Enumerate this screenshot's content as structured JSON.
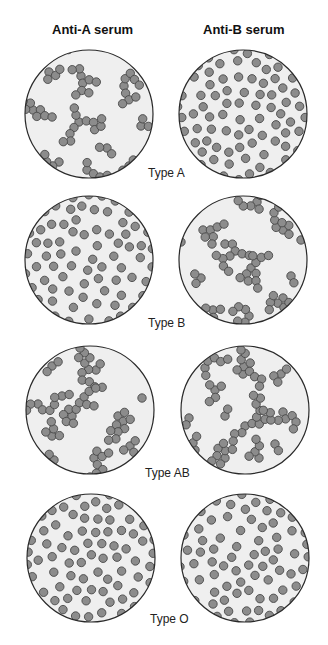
{
  "headings": {
    "col_a": "Anti-A serum",
    "col_b": "Anti-B serum"
  },
  "colors": {
    "dish_fill": "#efefef",
    "dish_stroke": "#2a2a2a",
    "cell_fill": "#8c8c8c",
    "cell_stroke": "#4a4a4a"
  },
  "rows": [
    {
      "label": "Type A",
      "anti_a": {
        "state": "agglutinated",
        "seed": 11,
        "clusters": [
          [
            -40,
            -42,
            4
          ],
          [
            -8,
            -38,
            9
          ],
          [
            35,
            -28,
            9
          ],
          [
            -56,
            -4,
            8
          ],
          [
            -10,
            8,
            12
          ],
          [
            18,
            34,
            3
          ],
          [
            -30,
            48,
            4
          ],
          [
            -2,
            56,
            7
          ],
          [
            40,
            52,
            3
          ],
          [
            -28,
            -64,
            4
          ],
          [
            52,
            12,
            3
          ],
          [
            60,
            48,
            3
          ]
        ]
      },
      "anti_b": {
        "state": "dispersed",
        "seed": 21,
        "count": 78
      },
      "label_pos": [
        148,
        166
      ]
    },
    {
      "label": "Type B",
      "anti_a": {
        "state": "dispersed",
        "seed": 31,
        "count": 80
      },
      "anti_b": {
        "state": "agglutinated",
        "seed": 41,
        "clusters": [
          [
            -40,
            -30,
            7
          ],
          [
            -18,
            -16,
            10
          ],
          [
            14,
            -58,
            7
          ],
          [
            8,
            8,
            11
          ],
          [
            40,
            -30,
            8
          ],
          [
            -42,
            18,
            3
          ],
          [
            48,
            16,
            2
          ],
          [
            -30,
            50,
            5
          ],
          [
            6,
            56,
            8
          ],
          [
            40,
            38,
            8
          ],
          [
            58,
            -20,
            1
          ],
          [
            -62,
            -18,
            2
          ]
        ]
      }
    },
    {
      "label": "Type AB",
      "anti_a": {
        "state": "agglutinated",
        "seed": 51,
        "clusters": [
          [
            -38,
            -44,
            3
          ],
          [
            6,
            -40,
            12
          ],
          [
            -52,
            -6,
            9
          ],
          [
            -28,
            -14,
            3
          ],
          [
            -18,
            6,
            12
          ],
          [
            28,
            6,
            10
          ],
          [
            -38,
            26,
            5
          ],
          [
            -36,
            50,
            2
          ],
          [
            4,
            48,
            9
          ],
          [
            40,
            36,
            4
          ],
          [
            52,
            -12,
            1
          ],
          [
            -10,
            -62,
            1
          ]
        ]
      },
      "anti_b": {
        "state": "agglutinated",
        "seed": 61,
        "clusters": [
          [
            -40,
            -42,
            6
          ],
          [
            -30,
            -20,
            5
          ],
          [
            -56,
            8,
            4
          ],
          [
            -2,
            -36,
            10
          ],
          [
            36,
            -36,
            4
          ],
          [
            -20,
            6,
            2
          ],
          [
            0,
            16,
            12
          ],
          [
            38,
            2,
            9
          ],
          [
            -50,
            40,
            3
          ],
          [
            -20,
            48,
            8
          ],
          [
            14,
            48,
            5
          ],
          [
            30,
            34,
            2
          ],
          [
            -4,
            -60,
            1
          ]
        ]
      }
    },
    {
      "label": "Type O",
      "anti_a": {
        "state": "dispersed",
        "seed": 71,
        "count": 82
      },
      "anti_b": {
        "state": "dispersed",
        "seed": 81,
        "count": 82
      }
    }
  ]
}
